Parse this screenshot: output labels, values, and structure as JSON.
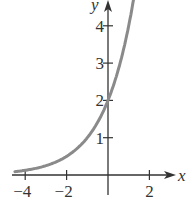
{
  "chart_data": {
    "type": "line",
    "title": "",
    "xlabel": "x",
    "ylabel": "y",
    "xlim": [
      -4.5,
      2.8
    ],
    "ylim": [
      -0.3,
      4.7
    ],
    "grid": false,
    "x_ticks": [
      -4,
      -2,
      2
    ],
    "y_ticks": [
      1,
      2,
      3,
      4
    ],
    "x_tick_labels": [
      "−4",
      "−2",
      "2"
    ],
    "y_tick_labels": [
      "1",
      "2",
      "3",
      "4"
    ],
    "series": [
      {
        "name": "y = 2^(x+1)",
        "color": "#8a8a8a",
        "x": [
          -4.5,
          -4,
          -3,
          -2,
          -1,
          0,
          0.5,
          1,
          1.3
        ],
        "y": [
          0.09,
          0.13,
          0.25,
          0.5,
          1,
          2,
          2.83,
          4,
          4.92
        ]
      }
    ],
    "annotations": []
  }
}
